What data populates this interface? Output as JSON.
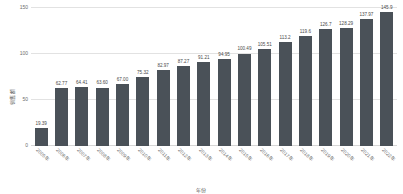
{
  "chart_data": {
    "type": "bar",
    "title": "",
    "xlabel": "年份",
    "ylabel": "销售额",
    "ylim": [
      0,
      150
    ],
    "yticks": [
      0,
      50,
      100,
      150
    ],
    "ytick_labels": [
      "0",
      "50",
      "100",
      "150"
    ],
    "grid": true,
    "legend": "none",
    "bar_color": "#4a5158",
    "gridline_color": "#e2e2e2",
    "label_color": "#6e6e6e",
    "categories": [
      "2005年",
      "2006年",
      "2007年",
      "2008年",
      "2009年",
      "2010年",
      "2011年",
      "2012年",
      "2013年",
      "2014年",
      "2015年",
      "2016年",
      "2017年",
      "2018年",
      "2019年",
      "2020年",
      "2021年",
      "2022年"
    ],
    "values": [
      19.39,
      62.77,
      64.41,
      63.6,
      67.0,
      75.32,
      82.97,
      87.27,
      91.21,
      94.95,
      100.49,
      105.51,
      113.2,
      119.6,
      126.7,
      128.29,
      137.97,
      145.9
    ],
    "value_labels": [
      "19.39",
      "62.77",
      "64.41",
      "63.60",
      "67.00",
      "75.32",
      "82.97",
      "87.27",
      "91.21",
      "94.95",
      "100.49",
      "105.51",
      "113.2",
      "119.6",
      "126.7",
      "128.29",
      "137.97",
      "145.9"
    ]
  }
}
